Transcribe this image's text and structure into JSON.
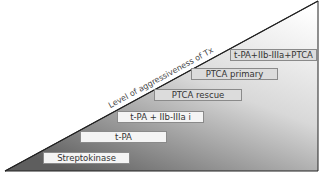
{
  "diagram": {
    "axis_label": "Level of aggressiveness of Tx",
    "steps": [
      {
        "label": "Streptokinase"
      },
      {
        "label": "t-PA"
      },
      {
        "label": "t-PA + IIb-IIIa i"
      },
      {
        "label": "PTCA rescue"
      },
      {
        "label": "PTCA primary"
      },
      {
        "label": "t-PA+IIb-IIIa+PTCA"
      }
    ],
    "colors": {
      "gradient_top": "#ffffff",
      "gradient_bottom": "#6e6e6e",
      "outline": "#222222"
    }
  }
}
